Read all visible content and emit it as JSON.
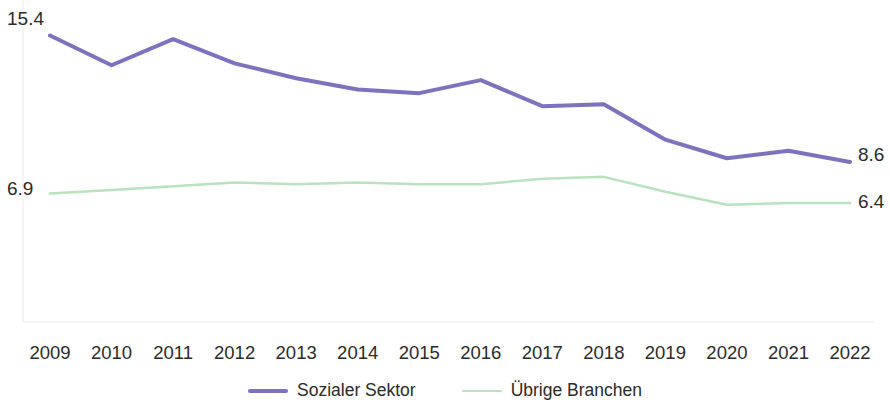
{
  "chart_data": {
    "type": "line",
    "title": "",
    "subtitle": "",
    "xlabel": "",
    "ylabel": "",
    "grid": false,
    "legend_position": "bottom-center",
    "axis_line_color": "#e8e8e8",
    "categories": [
      "2009",
      "2010",
      "2011",
      "2012",
      "2013",
      "2014",
      "2015",
      "2016",
      "2017",
      "2018",
      "2019",
      "2020",
      "2021",
      "2022"
    ],
    "ylim": [
      0,
      16.5
    ],
    "series": [
      {
        "name": "Sozialer Sektor",
        "color": "#7d72bd",
        "line_width": 4,
        "values": [
          15.4,
          13.8,
          15.2,
          13.9,
          13.1,
          12.5,
          12.3,
          13.0,
          11.6,
          11.7,
          9.8,
          8.8,
          9.2,
          8.6
        ],
        "start_label": "15.4",
        "end_label": "8.6"
      },
      {
        "name": "Übrige Branchen",
        "color": "#b9e3bd",
        "line_width": 2.5,
        "values": [
          6.9,
          7.1,
          7.3,
          7.5,
          7.4,
          7.5,
          7.4,
          7.4,
          7.7,
          7.8,
          7.0,
          6.3,
          6.4,
          6.4
        ],
        "start_label": "6.9",
        "end_label": "6.4"
      }
    ]
  },
  "legend": {
    "items": [
      {
        "label": "Sozialer Sektor",
        "color": "#7d72bd"
      },
      {
        "label": "Übrige Branchen",
        "color": "#b9e3bd"
      }
    ]
  }
}
